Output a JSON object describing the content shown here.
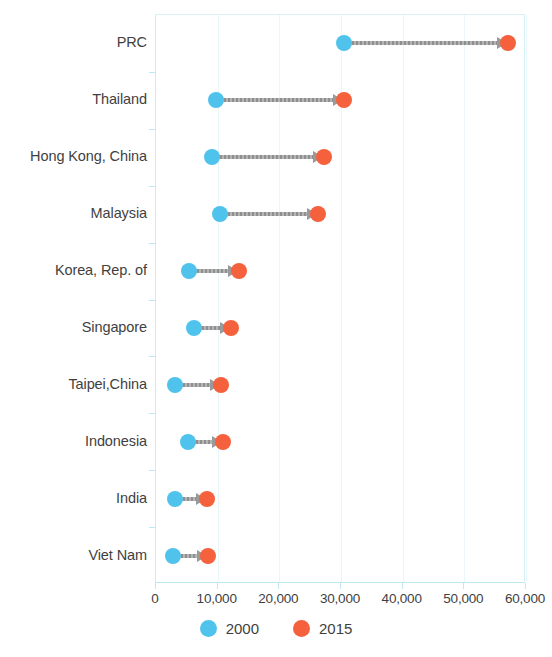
{
  "chart_data": {
    "type": "scatter",
    "subtype": "dumbbell-arrow",
    "title": "",
    "xlabel": "",
    "ylabel": "",
    "xlim": [
      0,
      60000
    ],
    "xticks": [
      0,
      10000,
      20000,
      30000,
      40000,
      50000,
      60000
    ],
    "xtick_labels": [
      "0",
      "10,000",
      "20,000",
      "30,000",
      "40,000",
      "50,000",
      "60,000"
    ],
    "grid": true,
    "grid_axis": "x",
    "legend_position": "bottom",
    "categories": [
      "PRC",
      "Thailand",
      "Hong Kong, China",
      "Malaysia",
      "Korea, Rep. of",
      "Singapore",
      "Taipei,China",
      "Indonesia",
      "India",
      "Viet Nam"
    ],
    "series": [
      {
        "name": "2000",
        "color": "#4fc3ec",
        "values": [
          30500,
          9700,
          9000,
          10300,
          5400,
          6200,
          3000,
          5200,
          3000,
          2800
        ]
      },
      {
        "name": "2015",
        "color": "#f4613c",
        "values": [
          57000,
          30500,
          27200,
          26200,
          13400,
          12100,
          10600,
          10800,
          8300,
          8500
        ]
      }
    ],
    "connector": {
      "color": "#9a9a9a",
      "style": "dashed-arrow",
      "direction": "2000-to-2015"
    }
  },
  "legend": {
    "items": [
      {
        "label": "2000",
        "swatch": "circle-blue",
        "color": "#4fc3ec"
      },
      {
        "label": "2015",
        "swatch": "circle-orange",
        "color": "#f4613c"
      }
    ]
  },
  "axis": {
    "x_tick_labels": [
      "0",
      "10,000",
      "20,000",
      "30,000",
      "40,000",
      "50,000",
      "60,000"
    ],
    "y_tick_labels": [
      "PRC",
      "Thailand",
      "Hong Kong, China",
      "Malaysia",
      "Korea, Rep. of",
      "Singapore",
      "Taipei,China",
      "Indonesia",
      "India",
      "Viet Nam"
    ]
  },
  "colors": {
    "series_2000": "#4fc3ec",
    "series_2015": "#f4613c",
    "connector": "#9a9a9a",
    "gridline": "#e9f7fb",
    "axis": "#bfe8f3",
    "text": "#3f3f3f"
  }
}
